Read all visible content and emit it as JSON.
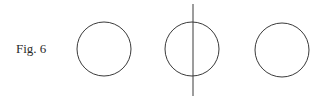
{
  "figure": {
    "label": "Fig. 6",
    "panels": [
      {
        "name": "circle"
      },
      {
        "name": "circle-with-vertical-line"
      },
      {
        "name": "circle"
      }
    ]
  }
}
